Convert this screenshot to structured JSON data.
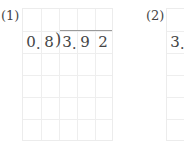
{
  "problems": [
    {
      "label": "(1)",
      "divisor": [
        "0",
        "8"
      ],
      "dividend": [
        "3",
        "9",
        "2"
      ],
      "decimal_mark": "."
    },
    {
      "label": "(2)",
      "dividend_partial": [
        "3"
      ],
      "decimal_mark": "."
    }
  ],
  "grid": {
    "columns": 5,
    "rows": 6
  },
  "colors": {
    "grid_line": "#eeeeee",
    "text": "#444444",
    "bracket": "#9a9a9a"
  }
}
